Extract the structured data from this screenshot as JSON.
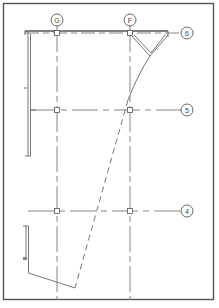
{
  "diagram": {
    "type": "structural-plan-grid",
    "colors": {
      "line": "#5a5a5a",
      "border": "#555555",
      "background": "#ffffff"
    },
    "columns": [
      {
        "label": "G",
        "x": 57
      },
      {
        "label": "F",
        "x": 130
      }
    ],
    "rows": [
      {
        "label": "6",
        "y": 33
      },
      {
        "label": "5",
        "y": 110
      },
      {
        "label": "4",
        "y": 211
      }
    ],
    "caption": ""
  }
}
